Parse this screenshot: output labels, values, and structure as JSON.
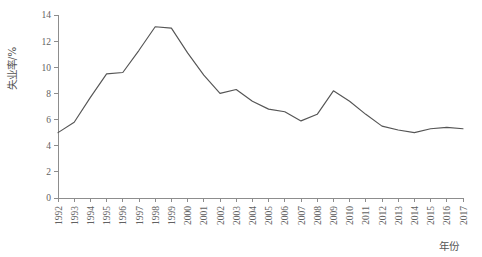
{
  "chart_data": {
    "type": "line",
    "title": "",
    "subtitle": "",
    "xlabel": "年份",
    "ylabel": "失业率/%",
    "grid": false,
    "legend": false,
    "legend_position": "none",
    "line_color": "#555555",
    "axis_color": "#8d8d8d",
    "xlim": [
      1992,
      2017
    ],
    "ylim": [
      0,
      14
    ],
    "ytick_step": 2,
    "x": [
      1992,
      1993,
      1994,
      1995,
      1996,
      1997,
      1998,
      1999,
      2000,
      2001,
      2002,
      2003,
      2004,
      2005,
      2006,
      2007,
      2008,
      2009,
      2010,
      2011,
      2012,
      2013,
      2014,
      2015,
      2016,
      2017
    ],
    "values": [
      5.0,
      5.8,
      7.7,
      9.5,
      9.6,
      11.3,
      13.1,
      13.0,
      11.1,
      9.4,
      8.0,
      8.3,
      7.4,
      6.8,
      6.6,
      5.9,
      6.4,
      8.2,
      7.4,
      6.4,
      5.5,
      5.2,
      5.0,
      5.3,
      5.4,
      5.3
    ],
    "x_tick_labels": [
      "1992",
      "1993",
      "1994",
      "1995",
      "1996",
      "1997",
      "1998",
      "1999",
      "2000",
      "2001",
      "2002",
      "2003",
      "2004",
      "2005",
      "2006",
      "2007",
      "2008",
      "2009",
      "2010",
      "2011",
      "2012",
      "2013",
      "2014",
      "2015",
      "2016",
      "2017"
    ],
    "y_tick_labels": [
      "0",
      "2",
      "4",
      "6",
      "8",
      "10",
      "12",
      "14"
    ],
    "y_tick_values": [
      0,
      2,
      4,
      6,
      8,
      10,
      12,
      14
    ]
  },
  "figure": {
    "background_color": "#ffffff",
    "plot_left_px": 58,
    "plot_right_px": 463,
    "plot_top_px": 15,
    "plot_bottom_px": 198
  }
}
